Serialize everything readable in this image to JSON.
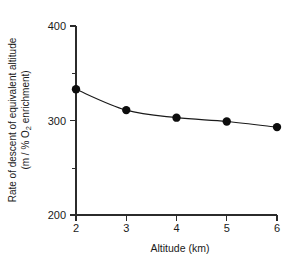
{
  "chart_data": {
    "type": "line",
    "title": "",
    "subtitle": "",
    "xlabel": "Altitude (km)",
    "ylabel_line1": "Rate of descent of equivalent altitude",
    "ylabel_line2_prefix": "(m / % O",
    "ylabel_line2_sub": "2",
    "ylabel_line2_suffix": " enrichment)",
    "ylabel_full": "Rate of descent of equivalent altitude (m / % O2 enrichment)",
    "x": [
      2,
      3,
      4,
      5,
      6
    ],
    "values": [
      333,
      311,
      303,
      299,
      293
    ],
    "series": [
      {
        "name": "Rate of descent of equivalent altitude",
        "x": [
          2,
          3,
          4,
          5,
          6
        ],
        "values": [
          333,
          311,
          303,
          299,
          293
        ]
      }
    ],
    "xlim": [
      2,
      6
    ],
    "ylim": [
      200,
      400
    ],
    "xticks": [
      2,
      3,
      4,
      5,
      6
    ],
    "xtick_labels": [
      "2",
      "3",
      "4",
      "5",
      "6"
    ],
    "yticks": [
      200,
      300,
      400
    ],
    "ytick_labels": [
      "200",
      "300",
      "400"
    ],
    "y_minor_ticks": [
      250,
      350
    ],
    "grid": false,
    "legend": false,
    "legend_position": "none",
    "marker": "filled-circle",
    "line_style": "solid",
    "colors": {
      "line": "#1a1a1a",
      "marker": "#0d0d0d",
      "axis": "#2b2b2b",
      "background": "#ffffff",
      "text": "#1a1a1a"
    }
  }
}
